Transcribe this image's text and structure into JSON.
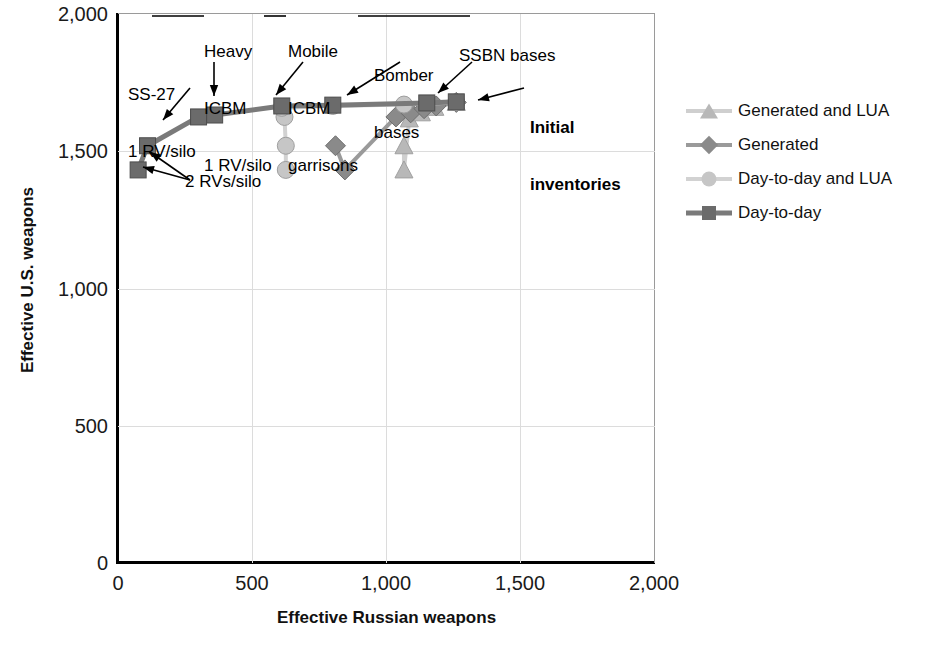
{
  "chart_data": {
    "type": "scatter",
    "title": "",
    "xlabel": "Effective Russian weapons",
    "ylabel": "Effective U.S. weapons",
    "xlim": [
      0,
      2000
    ],
    "ylim": [
      0,
      2000
    ],
    "xticks": [
      "0",
      "500",
      "1,000",
      "1,500",
      "2,000"
    ],
    "xtick_values": [
      0,
      500,
      1000,
      1500,
      2000
    ],
    "yticks": [
      "0",
      "500",
      "1,000",
      "1,500",
      "2,000"
    ],
    "ytick_values": [
      0,
      500,
      1000,
      1500,
      2000
    ],
    "grid": true,
    "legend_position": "right",
    "series": [
      {
        "name": "Generated and LUA",
        "marker": "triangle",
        "color": "#b8b8b8",
        "line_color": "#cfcfcf",
        "points": [
          {
            "x": 1065,
            "y": 1520
          },
          {
            "x": 1065,
            "y": 1432
          },
          {
            "x": 1085,
            "y": 1618
          },
          {
            "x": 1130,
            "y": 1640
          },
          {
            "x": 1180,
            "y": 1660
          },
          {
            "x": 1260,
            "y": 1678
          }
        ]
      },
      {
        "name": "Generated",
        "marker": "diamond",
        "color": "#8a8a8a",
        "line_color": "#9a9a9a",
        "points": [
          {
            "x": 810,
            "y": 1520
          },
          {
            "x": 845,
            "y": 1432
          },
          {
            "x": 1035,
            "y": 1625
          },
          {
            "x": 1090,
            "y": 1640
          },
          {
            "x": 1140,
            "y": 1655
          },
          {
            "x": 1185,
            "y": 1665
          },
          {
            "x": 1260,
            "y": 1678
          }
        ]
      },
      {
        "name": "Day-to-day and LUA",
        "marker": "circle",
        "color": "#c6c6c6",
        "line_color": "#d2d2d2",
        "points": [
          {
            "x": 625,
            "y": 1432
          },
          {
            "x": 625,
            "y": 1520
          },
          {
            "x": 620,
            "y": 1625
          },
          {
            "x": 610,
            "y": 1658
          },
          {
            "x": 800,
            "y": 1665
          },
          {
            "x": 1065,
            "y": 1670
          },
          {
            "x": 1260,
            "y": 1678
          }
        ]
      },
      {
        "name": "Day-to-day",
        "marker": "square",
        "color": "#6b6b6b",
        "line_color": "#7a7a7a",
        "points": [
          {
            "x": 75,
            "y": 1432
          },
          {
            "x": 110,
            "y": 1520
          },
          {
            "x": 300,
            "y": 1625
          },
          {
            "x": 360,
            "y": 1632
          },
          {
            "x": 610,
            "y": 1665
          },
          {
            "x": 800,
            "y": 1668
          },
          {
            "x": 1150,
            "y": 1676
          },
          {
            "x": 1260,
            "y": 1680
          }
        ]
      }
    ],
    "annotations": [
      {
        "id": "ss27",
        "text": "SS-27\n1 RV/silo"
      },
      {
        "id": "heavy_icbm",
        "text": "Heavy\nICBM\n1 RV/silo"
      },
      {
        "id": "mobile_icbm",
        "text": "Mobile\nICBM\ngarrisons"
      },
      {
        "id": "bomber_bases",
        "text": "Bomber\nbases"
      },
      {
        "id": "ssbn_bases",
        "text": "SSBN bases"
      },
      {
        "id": "initial_inventories",
        "text": "Initial\ninventories"
      },
      {
        "id": "two_rvs",
        "text": "2 RVs/silo"
      }
    ]
  },
  "legend": {
    "items": [
      {
        "label": "Generated and LUA",
        "marker": "triangle-icon",
        "color": "#b8b8b8",
        "line": "#cfcfcf"
      },
      {
        "label": "Generated",
        "marker": "diamond-icon",
        "color": "#8a8a8a",
        "line": "#9a9a9a"
      },
      {
        "label": "Day-to-day and LUA",
        "marker": "circle-icon",
        "color": "#c6c6c6",
        "line": "#d2d2d2"
      },
      {
        "label": "Day-to-day",
        "marker": "square-icon",
        "color": "#6b6b6b",
        "line": "#7a7a7a"
      }
    ]
  },
  "axes": {
    "x_title": "Effective Russian weapons",
    "y_title": "Effective U.S. weapons",
    "x_labels": [
      "0",
      "500",
      "1,000",
      "1,500",
      "2,000"
    ],
    "y_labels": [
      "0",
      "500",
      "1,000",
      "1,500",
      "2,000"
    ]
  },
  "annotations": {
    "ss27_line1": "SS-27",
    "ss27_line2": "1 RV/silo",
    "heavy_line1": "Heavy",
    "heavy_line2": "ICBM",
    "heavy_line3": "1 RV/silo",
    "mobile_line1": "Mobile",
    "mobile_line2": "ICBM",
    "mobile_line3": "garrisons",
    "bomber_line1": "Bomber",
    "bomber_line2": "bases",
    "ssbn": "SSBN bases",
    "initial_line1": "Initial",
    "initial_line2": "inventories",
    "two_rvs": "2 RVs/silo"
  }
}
